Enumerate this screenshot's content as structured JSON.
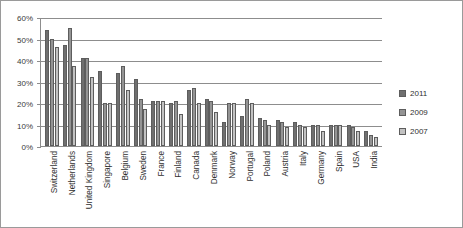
{
  "chart_data": {
    "type": "bar",
    "title": "",
    "subtitle": "",
    "xlabel": "",
    "ylabel": "",
    "ylim": [
      0,
      60
    ],
    "ytick_labels": [
      "0%",
      "10%",
      "20%",
      "30%",
      "40%",
      "50%",
      "60%"
    ],
    "ytick_values": [
      0,
      10,
      20,
      30,
      40,
      50,
      60
    ],
    "grid": true,
    "legend_position": "right",
    "categories": [
      "Switzerland",
      "Netherlands",
      "United Kingdom",
      "Singapore",
      "Belgium",
      "Sweden",
      "France",
      "Finland",
      "Canada",
      "Denmark",
      "Norway",
      "Portugal",
      "Poland",
      "Austria",
      "Italy",
      "Germany",
      "Spain",
      "USA",
      "India"
    ],
    "series": [
      {
        "name": "2011",
        "color": "#6f6f6f",
        "values": [
          54,
          47,
          41,
          35,
          34,
          31,
          21,
          20,
          26,
          22,
          11,
          14,
          13,
          12,
          11,
          10,
          10,
          10,
          7
        ]
      },
      {
        "name": "2009",
        "color": "#949494",
        "values": [
          50,
          55,
          41,
          20,
          37,
          22,
          21,
          21,
          27,
          21,
          20,
          22,
          12,
          11,
          10,
          10,
          10,
          9,
          5
        ]
      },
      {
        "name": "2007",
        "color": "#c2c2c2",
        "values": [
          46,
          37,
          32,
          20,
          26,
          17,
          21,
          15,
          20,
          16,
          20,
          20,
          10,
          9,
          9,
          7,
          10,
          7,
          4
        ]
      }
    ]
  },
  "legend": {
    "entries": [
      {
        "label": "2011",
        "color": "#6f6f6f"
      },
      {
        "label": "2009",
        "color": "#949494"
      },
      {
        "label": "2007",
        "color": "#c2c2c2"
      }
    ]
  }
}
